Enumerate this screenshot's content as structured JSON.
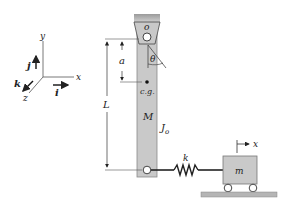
{
  "diagram": {
    "type": "mechanical-system",
    "coordinate_axes": {
      "x_label": "x",
      "y_label": "y",
      "z_label": "z",
      "unit_i": "i",
      "unit_j": "j",
      "unit_k": "k"
    },
    "pendulum": {
      "pivot_label": "o",
      "angle_label": "θ",
      "cg_label": "c.g.",
      "distance_to_cg_label": "a",
      "length_label": "L",
      "mass_label": "M",
      "inertia_label": "J",
      "inertia_subscript": "o"
    },
    "spring": {
      "label": "k"
    },
    "cart": {
      "mass_label": "m",
      "displacement_label": "x"
    },
    "colors": {
      "bar_fill": "#c9c9c9",
      "bar_stroke": "#8a8a8a",
      "ground_fill": "#b5b5b5",
      "line": "#222222"
    }
  }
}
